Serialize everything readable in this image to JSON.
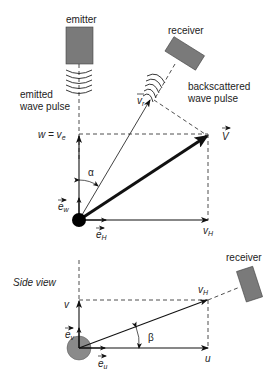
{
  "top_view": {
    "emitter_label": "emitter",
    "receiver_label": "receiver",
    "emitted_pulse_label_1": "emitted",
    "emitted_pulse_label_2": "wave pulse",
    "backscattered_label_1": "backscattered",
    "backscattered_label_2": "wave pulse",
    "w_label": "w = v",
    "w_sub": "e",
    "vr_label": "v",
    "vr_sub": "r",
    "V_label": "V",
    "alpha_label": "α",
    "ew_label": "e",
    "ew_sub": "w",
    "eH_label": "e",
    "eH_sub": "H",
    "vH_label": "v",
    "vH_sub": "H"
  },
  "side_view": {
    "title": "Side view",
    "receiver_label": "receiver",
    "v_label": "v",
    "vH_label": "v",
    "vH_sub": "H",
    "ev_label": "e",
    "ev_sub": "v",
    "eu_label": "e",
    "eu_sub": "u",
    "beta_label": "β",
    "u_label": "u"
  },
  "colors": {
    "device_fill": "#7a7a7a",
    "particle_top": "#000000",
    "particle_side": "#8a8a8a",
    "line": "#111111"
  }
}
